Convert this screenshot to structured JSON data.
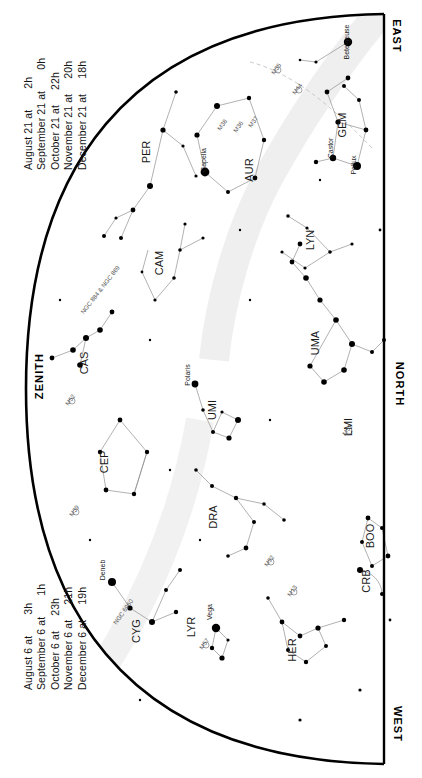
{
  "chart": {
    "type": "star-chart",
    "projection": "half-dome",
    "horizon_edge": "right-straight",
    "zenith_edge": "left-arc"
  },
  "legend_top": {
    "name": "upper-date-legend",
    "lines": [
      {
        "date": "August 21 at",
        "time": "2h"
      },
      {
        "date": "September 21 at",
        "time": "0h"
      },
      {
        "date": "October 21 at",
        "time": "22h"
      },
      {
        "date": "November 21 at",
        "time": "20h"
      },
      {
        "date": "December 21 at",
        "time": "18h"
      }
    ]
  },
  "legend_bottom": {
    "name": "lower-date-legend",
    "lines": [
      {
        "date": "August 6 at",
        "time": "3h"
      },
      {
        "date": "September 6 at",
        "time": "1h"
      },
      {
        "date": "October 6 at",
        "time": "23h"
      },
      {
        "date": "November 6 at",
        "time": "21h"
      },
      {
        "date": "December 6 at",
        "time": "19h"
      }
    ]
  },
  "cardinals": {
    "east": "EAST",
    "north": "NORTH",
    "west": "WEST",
    "zenith": "ZENITH"
  },
  "constellations": [
    {
      "abbr": "PER",
      "x": 150,
      "y": 152,
      "rot": -90
    },
    {
      "abbr": "AUR",
      "x": 253,
      "y": 170,
      "rot": -90
    },
    {
      "abbr": "GEM",
      "x": 346,
      "y": 125,
      "rot": -90
    },
    {
      "abbr": "CAM",
      "x": 163,
      "y": 263,
      "rot": -90
    },
    {
      "abbr": "LYN",
      "x": 314,
      "y": 240,
      "rot": -90
    },
    {
      "abbr": "CAS",
      "x": 88,
      "y": 363,
      "rot": -90
    },
    {
      "abbr": "CEP",
      "x": 108,
      "y": 462,
      "rot": -90
    },
    {
      "abbr": "UMI",
      "x": 216,
      "y": 410,
      "rot": -90
    },
    {
      "abbr": "UMA",
      "x": 319,
      "y": 343,
      "rot": -90
    },
    {
      "abbr": "LMI",
      "x": 352,
      "y": 427,
      "rot": -90
    },
    {
      "abbr": "DRA",
      "x": 217,
      "y": 517,
      "rot": -90
    },
    {
      "abbr": "CYG",
      "x": 140,
      "y": 631,
      "rot": -90
    },
    {
      "abbr": "LYR",
      "x": 195,
      "y": 627,
      "rot": -90
    },
    {
      "abbr": "HER",
      "x": 296,
      "y": 650,
      "rot": -90
    },
    {
      "abbr": "BOO",
      "x": 374,
      "y": 536,
      "rot": -90
    },
    {
      "abbr": "CRB",
      "x": 370,
      "y": 581,
      "rot": -90
    }
  ],
  "named_stars": [
    {
      "name": "Betelgeuse",
      "x": 349,
      "y": 42,
      "rot": -90
    },
    {
      "name": "Castor",
      "x": 333,
      "y": 148,
      "rot": -90
    },
    {
      "name": "Pollux",
      "x": 356,
      "y": 165,
      "rot": -90
    },
    {
      "name": "Capella",
      "x": 206,
      "y": 160,
      "rot": -90
    },
    {
      "name": "Polaris",
      "x": 190,
      "y": 375,
      "rot": -90
    },
    {
      "name": "Deneb",
      "x": 105,
      "y": 570,
      "rot": -90
    },
    {
      "name": "Vega",
      "x": 212,
      "y": 612,
      "rot": -90
    }
  ],
  "deep_sky_objects": [
    {
      "name": "M38",
      "x": 224,
      "y": 126,
      "rot": -55
    },
    {
      "name": "M36",
      "x": 240,
      "y": 128,
      "rot": -55
    },
    {
      "name": "M37",
      "x": 255,
      "y": 123,
      "rot": -55
    },
    {
      "name": "M44",
      "x": 299,
      "y": 90,
      "rot": -55
    },
    {
      "name": "M35",
      "x": 278,
      "y": 70,
      "rot": -55
    },
    {
      "name": "NGC 884 & NGC 869",
      "x": 102,
      "y": 291,
      "rot": -52
    },
    {
      "name": "M52",
      "x": 72,
      "y": 401,
      "rot": -55
    },
    {
      "name": "M51",
      "x": 349,
      "y": 431,
      "rot": -55
    },
    {
      "name": "M39",
      "x": 76,
      "y": 512,
      "rot": -55
    },
    {
      "name": "NGC 6960",
      "x": 125,
      "y": 613,
      "rot": -55
    },
    {
      "name": "M92",
      "x": 271,
      "y": 562,
      "rot": -55
    },
    {
      "name": "M13",
      "x": 294,
      "y": 592,
      "rot": -55
    },
    {
      "name": "M57",
      "x": 206,
      "y": 645,
      "rot": -55
    }
  ],
  "colors": {
    "horizon": "#000000",
    "star": "#000000",
    "constellation_line": "#8c8c8c",
    "milkyway": "#e8e8e8",
    "label": "#1a1a1a",
    "background": "#ffffff"
  }
}
